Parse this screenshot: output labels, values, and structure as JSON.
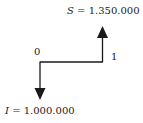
{
  "diagram": {
    "type": "cash-flow",
    "periods": [
      {
        "label": "0"
      },
      {
        "label": "1"
      }
    ],
    "inflow": {
      "symbol": "S",
      "equals": "=",
      "value": "1.350.000",
      "period": "1",
      "direction": "up"
    },
    "outflow": {
      "symbol": "I",
      "equals": "=",
      "value": "1.000.000",
      "period": "0",
      "direction": "down"
    },
    "line_color": "#1a1a1a"
  }
}
